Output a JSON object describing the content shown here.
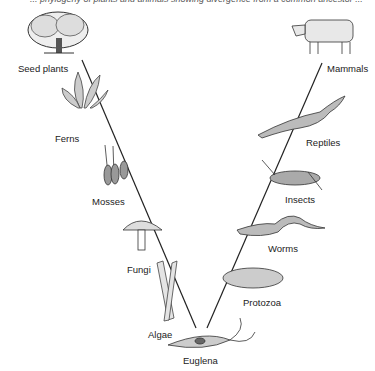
{
  "caption_cut": "... phylogeny of plants and animals showing divergence from a common ancestor ...",
  "left_branch": {
    "labels": [
      "Seed plants",
      "Ferns",
      "Mosses",
      "Fungi",
      "Algae"
    ]
  },
  "right_branch": {
    "labels": [
      "Mammals",
      "Reptiles",
      "Insects",
      "Worms",
      "Protozoa"
    ]
  },
  "root": {
    "label": "Euglena"
  },
  "colors": {
    "ink": "#222222",
    "shade": "#9a9a9a",
    "background": "#ffffff"
  }
}
